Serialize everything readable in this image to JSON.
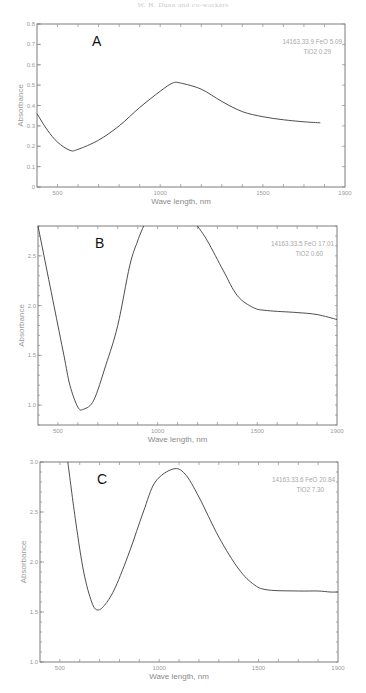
{
  "header": {
    "text": "W. H. Dunn and co-workers"
  },
  "chart_data": [
    {
      "type": "line",
      "panel": "A",
      "annotation": [
        "14163.33.9  FeO 5.09",
        "TiO2 0.29"
      ],
      "xlabel": "Wave length, nm",
      "ylabel": "Absorbance",
      "xlim": [
        400,
        1900
      ],
      "ylim": [
        0,
        0.8
      ],
      "xticks": [
        500,
        1000,
        1500,
        1900
      ],
      "yticks": [
        0,
        0.1,
        0.2,
        0.3,
        0.4,
        0.5,
        0.6,
        0.7,
        0.8
      ],
      "ytick_labels": [
        "0",
        "0.1",
        "0.2",
        "0.3",
        "0.4",
        "0.5",
        "0.6",
        "0.7",
        "0.8"
      ],
      "series": [
        {
          "name": "14163.33.9",
          "segments": [
            [
              [
                400,
                0.36
              ],
              [
                450,
                0.28
              ],
              [
                500,
                0.22
              ],
              [
                560,
                0.18
              ],
              [
                600,
                0.185
              ],
              [
                700,
                0.23
              ],
              [
                800,
                0.3
              ],
              [
                900,
                0.39
              ],
              [
                1000,
                0.47
              ],
              [
                1060,
                0.51
              ],
              [
                1100,
                0.51
              ],
              [
                1200,
                0.48
              ],
              [
                1300,
                0.42
              ],
              [
                1400,
                0.37
              ],
              [
                1500,
                0.345
              ],
              [
                1600,
                0.33
              ],
              [
                1700,
                0.32
              ],
              [
                1780,
                0.315
              ]
            ]
          ]
        }
      ],
      "frame": {
        "top": 24,
        "bottom": 187,
        "left": 37,
        "right": 345
      }
    },
    {
      "type": "line",
      "panel": "B",
      "annotation": [
        "14163.33.5  FeO 17.01",
        "TiO2 0.60"
      ],
      "xlabel": "Wave length, nm",
      "ylabel": "Absorbance",
      "xlim": [
        400,
        1900
      ],
      "ylim": [
        0.8,
        2.8
      ],
      "xticks": [
        500,
        1000,
        1500,
        1900
      ],
      "yticks": [
        1.0,
        1.5,
        2.0,
        2.5
      ],
      "ytick_labels": [
        "1.0",
        "1.5",
        "2.0",
        "2.5"
      ],
      "series": [
        {
          "name": "14163.33.5",
          "segments": [
            [
              [
                400,
                2.8
              ],
              [
                430,
                2.5
              ],
              [
                480,
                2.0
              ],
              [
                530,
                1.5
              ],
              [
                560,
                1.2
              ],
              [
                600,
                0.98
              ],
              [
                630,
                0.96
              ],
              [
                680,
                1.05
              ],
              [
                740,
                1.4
              ],
              [
                800,
                1.8
              ],
              [
                860,
                2.4
              ],
              [
                900,
                2.65
              ],
              [
                930,
                2.8
              ]
            ],
            [
              [
                1200,
                2.8
              ],
              [
                1250,
                2.65
              ],
              [
                1330,
                2.35
              ],
              [
                1400,
                2.1
              ],
              [
                1480,
                1.98
              ],
              [
                1550,
                1.95
              ],
              [
                1700,
                1.93
              ],
              [
                1800,
                1.91
              ],
              [
                1900,
                1.86
              ]
            ]
          ]
        }
      ],
      "frame": {
        "top": 226,
        "bottom": 425,
        "left": 38,
        "right": 337
      }
    },
    {
      "type": "line",
      "panel": "C",
      "annotation": [
        "14163.33.6  FeO 20.84",
        "TiO2  7.30"
      ],
      "xlabel": "Wave length, nm",
      "ylabel": "Absorbance",
      "xlim": [
        400,
        1900
      ],
      "ylim": [
        1.0,
        3.0
      ],
      "xticks": [
        500,
        1000,
        1500,
        1900
      ],
      "yticks": [
        1.0,
        1.5,
        2.0,
        2.5,
        3.0
      ],
      "ytick_labels": [
        "1.0",
        "1.5",
        "2.0",
        "2.5",
        "3.0"
      ],
      "series": [
        {
          "name": "14163.33.6",
          "segments": [
            [
              [
                540,
                3.0
              ],
              [
                580,
                2.4
              ],
              [
                620,
                1.9
              ],
              [
                660,
                1.6
              ],
              [
                690,
                1.52
              ],
              [
                730,
                1.58
              ],
              [
                780,
                1.75
              ],
              [
                850,
                2.1
              ],
              [
                920,
                2.5
              ],
              [
                980,
                2.8
              ],
              [
                1070,
                2.93
              ],
              [
                1130,
                2.88
              ],
              [
                1200,
                2.65
              ],
              [
                1300,
                2.25
              ],
              [
                1400,
                1.93
              ],
              [
                1480,
                1.77
              ],
              [
                1550,
                1.72
              ],
              [
                1700,
                1.71
              ],
              [
                1800,
                1.71
              ],
              [
                1860,
                1.7
              ],
              [
                1900,
                1.7
              ]
            ]
          ]
        }
      ],
      "frame": {
        "top": 462,
        "bottom": 662,
        "left": 40,
        "right": 338
      }
    }
  ]
}
